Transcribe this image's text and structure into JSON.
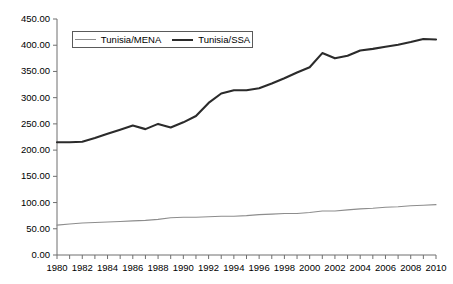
{
  "chart_data": {
    "type": "line",
    "title": "",
    "subtitle": "",
    "xlabel": "",
    "ylabel": "",
    "grid": false,
    "legend_position": "top-center",
    "xlim": [
      1980,
      2010
    ],
    "ylim": [
      0,
      450
    ],
    "y_tick_step": 50,
    "x": [
      1980,
      1981,
      1982,
      1983,
      1984,
      1985,
      1986,
      1987,
      1988,
      1989,
      1990,
      1991,
      1992,
      1993,
      1994,
      1995,
      1996,
      1997,
      1998,
      1999,
      2000,
      2001,
      2002,
      2003,
      2004,
      2005,
      2006,
      2007,
      2008,
      2009,
      2010
    ],
    "x_tick_labels": [
      "1980",
      "",
      "1982",
      "",
      "1984",
      "",
      "1986",
      "",
      "1988",
      "",
      "1990",
      "",
      "1992",
      "",
      "1994",
      "",
      "1996",
      "",
      "1998",
      "",
      "2000",
      "",
      "2002",
      "",
      "2004",
      "",
      "2006",
      "",
      "2008",
      "",
      "2010"
    ],
    "y_tick_labels": [
      "0.00",
      "50.00",
      "100.00",
      "150.00",
      "200.00",
      "250.00",
      "300.00",
      "350.00",
      "400.00",
      "450.00"
    ],
    "y_tick_values": [
      0,
      50,
      100,
      150,
      200,
      250,
      300,
      350,
      400,
      450
    ],
    "series": [
      {
        "name": "Tunisia/MENA",
        "color": "#8d8d8d",
        "width": 1.1,
        "values": [
          57,
          59,
          61,
          62,
          63,
          64,
          65,
          66,
          68,
          71,
          72,
          72,
          73,
          74,
          74,
          75,
          77,
          78,
          79,
          79,
          81,
          84,
          84,
          86,
          88,
          89,
          91,
          92,
          94,
          95,
          96
        ]
      },
      {
        "name": "Tunisia/SSA",
        "color": "#2b2b2b",
        "width": 2.1,
        "values": [
          215,
          215,
          216,
          223,
          231,
          239,
          247,
          240,
          250,
          243,
          253,
          265,
          290,
          308,
          314,
          314,
          318,
          327,
          337,
          348,
          358,
          385,
          375,
          380,
          390,
          393,
          397,
          401,
          406,
          412,
          411
        ]
      }
    ]
  },
  "legend": {
    "items": [
      {
        "label": "Tunisia/MENA",
        "swatch": "thin-gray-line"
      },
      {
        "label": "Tunisia/SSA",
        "swatch": "thick-dark-line"
      }
    ]
  }
}
